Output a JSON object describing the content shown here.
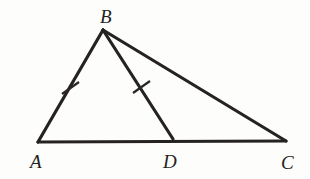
{
  "figure": {
    "type": "geometry-diagram",
    "background_color": "#fdfdfc",
    "ink_color": "#262222",
    "stroke_width": 3.2,
    "points": [
      {
        "id": "A",
        "label": "A",
        "x": 38,
        "y": 142,
        "label_x": 30,
        "label_y": 168
      },
      {
        "id": "B",
        "label": "B",
        "x": 103,
        "y": 30,
        "label_x": 100,
        "label_y": 23
      },
      {
        "id": "D",
        "label": "D",
        "x": 173,
        "y": 139,
        "label_x": 163,
        "label_y": 168
      },
      {
        "id": "C",
        "label": "C",
        "x": 286,
        "y": 141,
        "label_x": 281,
        "label_y": 169
      }
    ],
    "segments": [
      {
        "id": "AB",
        "from": "A",
        "to": "B",
        "role": "side"
      },
      {
        "id": "BC",
        "from": "B",
        "to": "C",
        "role": "side"
      },
      {
        "id": "AC",
        "from": "A",
        "to": "C",
        "role": "base"
      },
      {
        "id": "BD",
        "from": "B",
        "to": "D",
        "role": "cevian"
      }
    ],
    "tick_marks": [
      {
        "on_segment": "AB",
        "count": 1,
        "cx": 70,
        "cy": 88,
        "x1": 62,
        "y1": 94,
        "x2": 79,
        "y2": 82
      },
      {
        "on_segment": "BD",
        "count": 1,
        "cx": 141,
        "cy": 87,
        "x1": 133,
        "y1": 93,
        "x2": 150,
        "y2": 81
      }
    ],
    "congruence_note": "AB = BD"
  }
}
